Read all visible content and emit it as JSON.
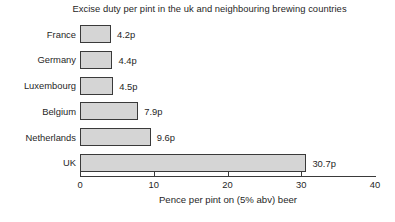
{
  "chart_data": {
    "type": "bar",
    "orientation": "horizontal",
    "title": "Excise duty per pint in the uk and neighbouring brewing countries",
    "xlabel": "Pence per pint on (5% abv) beer",
    "ylabel": "",
    "xlim": [
      0,
      40
    ],
    "xticks": [
      "0",
      "10",
      "20",
      "30",
      "40"
    ],
    "xtick_values": [
      0,
      10,
      20,
      30,
      40
    ],
    "grid": false,
    "legend": null,
    "categories": [
      "France",
      "Germany",
      "Luxembourg",
      "Belgium",
      "Netherlands",
      "UK"
    ],
    "values": [
      4.2,
      4.4,
      4.5,
      7.9,
      9.6,
      30.7
    ],
    "value_labels": [
      "4.2p",
      "4.4p",
      "4.5p",
      "7.9p",
      "9.6p",
      "30.7p"
    ],
    "bar_fill_color": "#d5d5d5",
    "bar_edge_color": "#3a3a3a",
    "axis_color": "#3a3a3a",
    "text_color": "#1f1f1f"
  },
  "caption": {
    "text": ""
  }
}
